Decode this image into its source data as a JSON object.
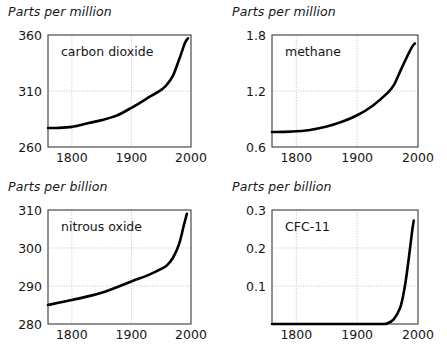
{
  "figure": {
    "width": 447,
    "height": 351,
    "background": "#ffffff",
    "curve_color": "#000000",
    "frame_color": "#3a3a3a",
    "grid_color": "#b9b9b9"
  },
  "chart_data": [
    {
      "type": "line",
      "id": "carbon-dioxide",
      "title": "Parts per million",
      "series_label": "carbon dioxide",
      "ylabel": "Parts per million",
      "xlabel": "",
      "grid": true,
      "legend": "inside-top-left",
      "xlim": [
        1760,
        2000
      ],
      "ylim": [
        260,
        360
      ],
      "xticks": [
        1800,
        1900,
        2000
      ],
      "yticks": [
        260,
        310,
        360
      ],
      "ytick_labels": [
        "260",
        "310",
        "360"
      ],
      "xtick_labels": [
        "1800",
        "1900",
        "2000"
      ],
      "x": [
        1760,
        1775,
        1800,
        1825,
        1850,
        1875,
        1900,
        1925,
        1950,
        1960,
        1970,
        1980,
        1990,
        1995
      ],
      "values": [
        277,
        277,
        278,
        281,
        284,
        288,
        295,
        303,
        311,
        316,
        324,
        338,
        353,
        357
      ]
    },
    {
      "type": "line",
      "id": "methane",
      "title": "Parts per million",
      "series_label": "methane",
      "ylabel": "Parts per million",
      "xlabel": "",
      "grid": true,
      "legend": "inside-top-left",
      "xlim": [
        1760,
        2000
      ],
      "ylim": [
        0.6,
        1.8
      ],
      "xticks": [
        1800,
        1900,
        2000
      ],
      "yticks": [
        0.6,
        1.2,
        1.8
      ],
      "ytick_labels": [
        "0.6",
        "1.2",
        "1.8"
      ],
      "xtick_labels": [
        "1800",
        "1900",
        "2000"
      ],
      "x": [
        1760,
        1790,
        1820,
        1850,
        1875,
        1900,
        1925,
        1950,
        1960,
        1970,
        1980,
        1990,
        1995
      ],
      "values": [
        0.76,
        0.765,
        0.78,
        0.82,
        0.87,
        0.94,
        1.04,
        1.18,
        1.26,
        1.4,
        1.54,
        1.67,
        1.71
      ]
    },
    {
      "type": "line",
      "id": "nitrous-oxide",
      "title": "Parts per billion",
      "series_label": "nitrous oxide",
      "ylabel": "Parts per billion",
      "xlabel": "",
      "grid": true,
      "legend": "inside-top-left",
      "xlim": [
        1760,
        2000
      ],
      "ylim": [
        280,
        310
      ],
      "xticks": [
        1800,
        1900,
        2000
      ],
      "yticks": [
        280,
        290,
        300,
        310
      ],
      "ytick_labels": [
        "280",
        "290",
        "300",
        "310"
      ],
      "xtick_labels": [
        "1800",
        "1900",
        "2000"
      ],
      "x": [
        1760,
        1800,
        1850,
        1900,
        1930,
        1950,
        1960,
        1970,
        1980,
        1988,
        1993
      ],
      "values": [
        285,
        286.3,
        288.2,
        291.2,
        293,
        294.5,
        295.5,
        297.5,
        301,
        306,
        309
      ]
    },
    {
      "type": "line",
      "id": "cfc-11",
      "title": "Parts per billion",
      "series_label": "CFC-11",
      "ylabel": "Parts per billion",
      "xlabel": "",
      "grid": true,
      "legend": "inside-top-left",
      "xlim": [
        1760,
        2000
      ],
      "ylim": [
        0.0,
        0.3
      ],
      "xticks": [
        1800,
        1900,
        2000
      ],
      "yticks": [
        0.1,
        0.2,
        0.3
      ],
      "ytick_labels": [
        "0.1",
        "0.2",
        "0.3"
      ],
      "xtick_labels": [
        "1800",
        "1900",
        "2000"
      ],
      "x": [
        1760,
        1900,
        1940,
        1950,
        1960,
        1970,
        1975,
        1980,
        1985,
        1990,
        1993
      ],
      "values": [
        0.0,
        0.0,
        0.0,
        0.002,
        0.012,
        0.04,
        0.07,
        0.115,
        0.175,
        0.24,
        0.272
      ]
    }
  ]
}
